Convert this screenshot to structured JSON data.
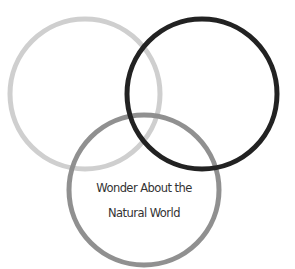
{
  "diagram": {
    "type": "venn",
    "circles": [
      {
        "name": "light-circle",
        "color": "#cfcfcf",
        "cx": 85,
        "cy": 94,
        "r": 75
      },
      {
        "name": "dark-circle",
        "color": "#222222",
        "cx": 202,
        "cy": 94,
        "r": 75
      },
      {
        "name": "medium-circle",
        "color": "#8a8a8a",
        "cx": 144,
        "cy": 190,
        "r": 75
      }
    ],
    "label": {
      "line1": "Wonder About the",
      "line2": "Natural World"
    }
  }
}
